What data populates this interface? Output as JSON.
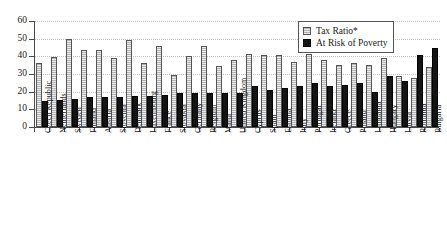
{
  "chart_data": {
    "type": "bar",
    "title": "",
    "subtitle": "",
    "xlabel": "",
    "ylabel": "",
    "ylim": [
      0,
      60
    ],
    "yticks": [
      0,
      10,
      20,
      30,
      40,
      50,
      60
    ],
    "ytick_labels": [
      "0",
      "10",
      "20",
      "30",
      "40",
      "50",
      "60"
    ],
    "grid": true,
    "grid_axis": "y",
    "legend_position": "top-right",
    "categories": [
      "Czech Republic",
      "Netherlands",
      "Sweden",
      "Finland",
      "Austria",
      "Slovenia",
      "Denmark",
      "Luxembourg",
      "France",
      "Slovakia",
      "Germany",
      "Belgium",
      "Malta",
      "United Kingdom",
      "Cyprus",
      "Spain",
      "Estonia",
      "Italy",
      "Portugal",
      "Ireland",
      "Greece",
      "Poland",
      "Lithuania",
      "Hungary",
      "Latvia",
      "Romania",
      "Bulgaria"
    ],
    "series": [
      {
        "name": "Tax Ratio*",
        "color": "#b4b4b4",
        "values": [
          36.5,
          39.5,
          50.0,
          43.5,
          43.5,
          39.0,
          49.5,
          36.0,
          46.0,
          29.5,
          40.0,
          46.0,
          34.5,
          38.0,
          41.5,
          40.5,
          40.5,
          37.0,
          41.5,
          38.0,
          35.0,
          36.0,
          35.0,
          39.0,
          29.0,
          28.0,
          34.0
        ]
      },
      {
        "name": "At Risk of Poverty",
        "color": "#141414",
        "values": [
          14.5,
          15.5,
          16.0,
          17.0,
          17.0,
          17.0,
          17.5,
          17.5,
          18.0,
          19.5,
          19.5,
          19.5,
          19.5,
          19.5,
          23.0,
          21.0,
          22.0,
          23.0,
          25.0,
          23.0,
          24.0,
          25.0,
          20.0,
          29.0,
          26.0,
          41.0,
          45.0
        ]
      }
    ],
    "annotations": []
  },
  "legend": {
    "items": [
      {
        "label": "Tax Ratio*",
        "swatch": "tax"
      },
      {
        "label": "At Risk of Poverty",
        "swatch": "pov"
      }
    ]
  }
}
